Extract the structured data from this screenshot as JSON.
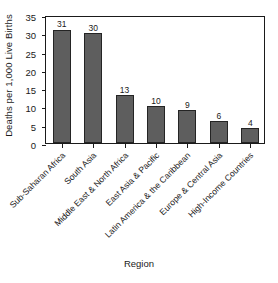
{
  "chart_data": {
    "type": "bar",
    "title": "",
    "xlabel": "Region",
    "ylabel": "Deaths per 1,000 Live Births",
    "categories": [
      "Sub-Saharan Africa",
      "South Asia",
      "Middle East & North Africa",
      "East Asia & Pacific",
      "Latin America & the Caribbean",
      "Europe & Central Asia",
      "High-Income Countries"
    ],
    "values": [
      31,
      30,
      13,
      10,
      9,
      6,
      4
    ],
    "value_labels": [
      "31",
      "30",
      "13",
      "10",
      "9",
      "6",
      "4"
    ],
    "ylim": [
      0,
      35
    ],
    "ytick_labels": [
      "0",
      "5",
      "10",
      "15",
      "20",
      "25",
      "30",
      "35"
    ],
    "ytick_values": [
      0,
      5,
      10,
      15,
      20,
      25,
      30,
      35
    ],
    "grid": false,
    "legend": "none",
    "bar_color": "#5e5e5e",
    "bar_edge_color": "#242424",
    "axis_color": "#1a1a1a",
    "background": "#ffffff"
  }
}
